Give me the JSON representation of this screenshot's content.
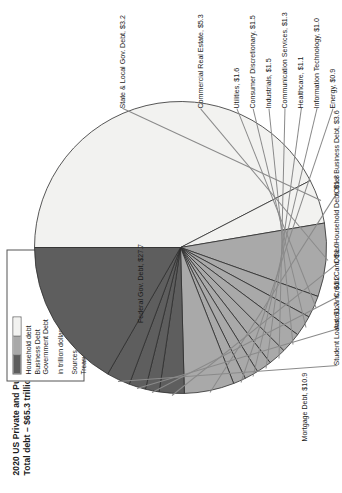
{
  "title": {
    "line1": "2020 US Private and Public Debt by Sector",
    "line2": "Total debt – $65.3 trillion"
  },
  "legend": {
    "items": [
      {
        "label": "Household debt",
        "color": "#5e5e5e"
      },
      {
        "label": "Business Debt",
        "color": "#a9a9a9"
      },
      {
        "label": "Government Debt",
        "color": "#f2f2f0"
      }
    ],
    "units": "in trillion dollars",
    "sources_line1": "Sources – Federal Reserve,",
    "sources_line2": "Treasurydirect.gov, S&P"
  },
  "chart_data": {
    "type": "pie",
    "title": "2020 US Private and Public Debt by Sector",
    "subtitle": "Total debt – $65.3 trillion",
    "units": "trillion dollars",
    "total": 65.3,
    "legend_position": "top-right",
    "grid": false,
    "categories": [
      "Federal Gov. Debt",
      "State & Local Gov. Debt",
      "Commercial Real Estate",
      "Utilities",
      "Consumer Discretionary",
      "Industrials",
      "Communication Services",
      "Healthcare",
      "Information Technology",
      "Energy",
      "Other Business Debt",
      "Other Household Debt",
      "Credit Card",
      "Auto Loans",
      "Student Loans",
      "Mortgage Debt"
    ],
    "values": [
      27.7,
      3.2,
      5.3,
      1.6,
      1.5,
      1.5,
      1.3,
      1.1,
      1.0,
      0.9,
      3.6,
      1.8,
      1.0,
      1.2,
      1.7,
      10.9
    ],
    "slice_labels": [
      "Federal Gov. Debt, $27.7",
      "State & Local Gov. Debt, $3.2",
      "Commercial Real Estate, $5.3",
      "Utilities, $1.6",
      "Consumer Discretionary, $1.5",
      "Industrials, $1.5",
      "Communication Services, $1.3",
      "Healthcare, $1.1",
      "Information Technology, $1.0",
      "Energy, $0.9",
      "Other Business Debt, $3.6",
      "Other Household Debt, $1.8",
      "Credit Card, $1.0",
      "Auto Loans, $1.2",
      "Student Loans, $1.7",
      "Mortgage Debt, $10.9"
    ],
    "groups": [
      {
        "name": "Government Debt",
        "color": "#f2f2f0",
        "members": [
          "Federal Gov. Debt",
          "State & Local Gov. Debt"
        ]
      },
      {
        "name": "Business Debt",
        "color": "#a9a9a9",
        "members": [
          "Commercial Real Estate",
          "Utilities",
          "Consumer Discretionary",
          "Industrials",
          "Communication Services",
          "Healthcare",
          "Information Technology",
          "Energy",
          "Other Business Debt"
        ]
      },
      {
        "name": "Household debt",
        "color": "#5e5e5e",
        "members": [
          "Other Household Debt",
          "Credit Card",
          "Auto Loans",
          "Student Loans",
          "Mortgage Debt"
        ]
      }
    ]
  }
}
